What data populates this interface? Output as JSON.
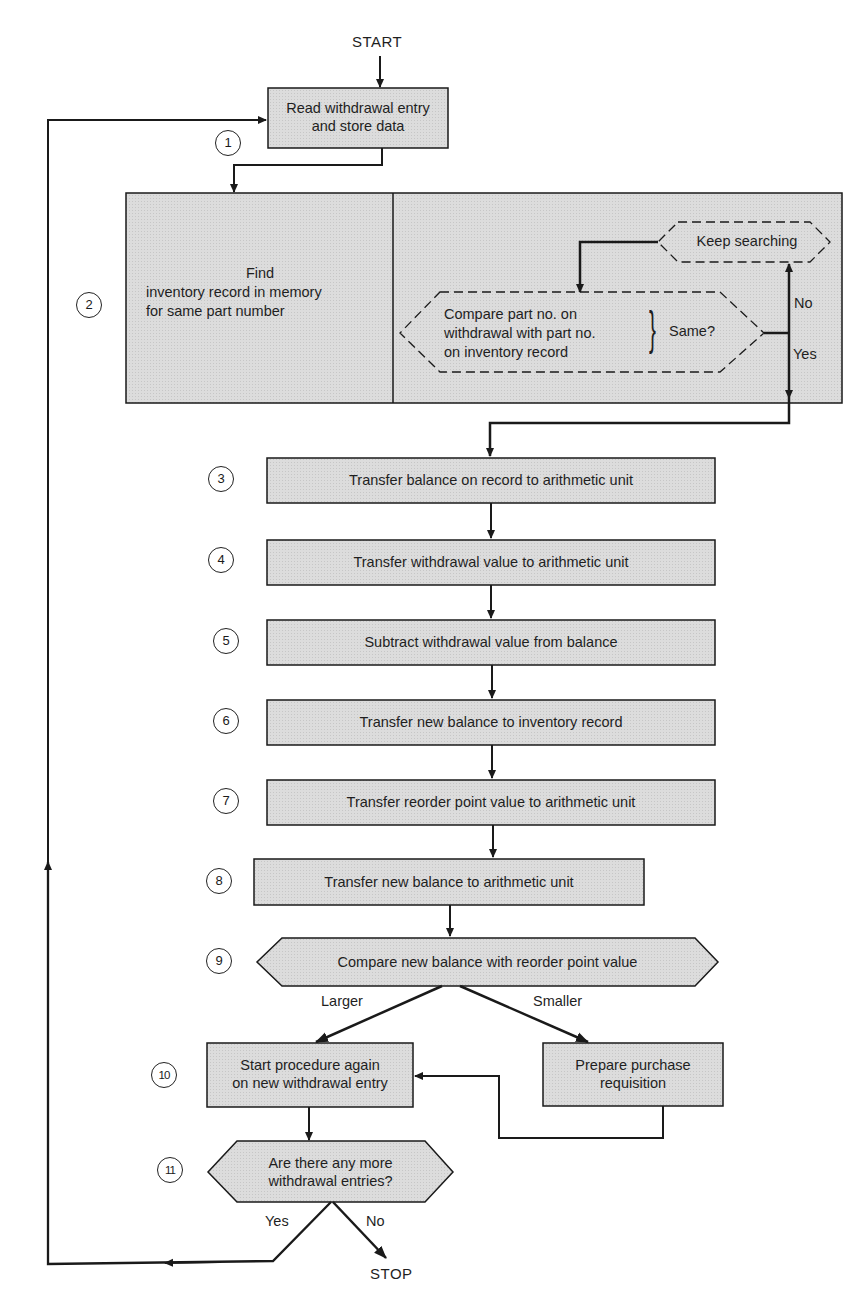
{
  "diagram": {
    "type": "flowchart",
    "start_label": "START",
    "stop_label": "STOP",
    "fill_color": "#d9d9d9",
    "line_color": "#1a1a1a",
    "steps": [
      {
        "num": "1",
        "text": "Read withdrawal entry and store data",
        "lines": [
          "Read withdrawal entry",
          "and store data"
        ],
        "shape": "process"
      },
      {
        "num": "2",
        "text": "Find inventory record in memory for same part number",
        "lines": [
          "Find",
          "inventory record in memory",
          "for same part number"
        ],
        "shape": "process"
      },
      {
        "num": "3",
        "text": "Transfer balance on record to arithmetic unit",
        "shape": "process"
      },
      {
        "num": "4",
        "text": "Transfer withdrawal value to arithmetic unit",
        "shape": "process"
      },
      {
        "num": "5",
        "text": "Subtract withdrawal value from balance",
        "shape": "process"
      },
      {
        "num": "6",
        "text": "Transfer new balance to inventory record",
        "shape": "process"
      },
      {
        "num": "7",
        "text": "Transfer reorder point value to arithmetic unit",
        "shape": "process"
      },
      {
        "num": "8",
        "text": "Transfer new balance to arithmetic unit",
        "shape": "process"
      },
      {
        "num": "9",
        "text": "Compare new balance with reorder point value",
        "shape": "decision"
      },
      {
        "num": "10",
        "text": "Start procedure again on new withdrawal entry",
        "lines": [
          "Start procedure again",
          "on new withdrawal entry"
        ],
        "shape": "process"
      },
      {
        "num": "11",
        "text": "Are there any more withdrawal entries?",
        "lines": [
          "Are there any more",
          "withdrawal entries?"
        ],
        "shape": "decision"
      }
    ],
    "subprocess_2": {
      "keep_searching": "Keep searching",
      "compare_lines": [
        "Compare part no. on",
        "withdrawal with part no.",
        "on inventory record"
      ],
      "same_label": "Same?",
      "no_label": "No",
      "yes_label": "Yes"
    },
    "extra_nodes": {
      "purchase_lines": [
        "Prepare purchase",
        "requisition"
      ]
    },
    "branch_labels": {
      "larger": "Larger",
      "smaller": "Smaller",
      "yes": "Yes",
      "no": "No"
    }
  }
}
